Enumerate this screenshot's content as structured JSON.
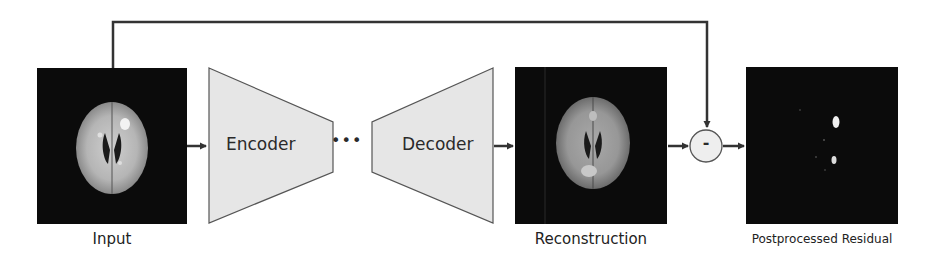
{
  "diagram": {
    "type": "autoencoder-anomaly-pipeline",
    "nodes": [
      {
        "id": "input",
        "label": "Input",
        "kind": "image",
        "content": "axial brain MRI slice with bright lesion"
      },
      {
        "id": "encoder",
        "label": "Encoder",
        "kind": "block-trapezoid-narrowing"
      },
      {
        "id": "bottleneck",
        "label": "•••",
        "kind": "ellipsis"
      },
      {
        "id": "decoder",
        "label": "Decoder",
        "kind": "block-trapezoid-widening"
      },
      {
        "id": "reconstruction",
        "label": "Reconstruction",
        "kind": "image",
        "content": "reconstructed brain MRI slice"
      },
      {
        "id": "subtract",
        "label": "-",
        "kind": "operator-circle"
      },
      {
        "id": "residual",
        "label": "Postprocessed Residual",
        "kind": "image",
        "content": "dark residual map with small bright spots"
      }
    ],
    "edges": [
      {
        "from": "input",
        "to": "encoder"
      },
      {
        "from": "decoder",
        "to": "reconstruction"
      },
      {
        "from": "reconstruction",
        "to": "subtract"
      },
      {
        "from": "input",
        "to": "subtract",
        "route": "skip-connection-over-top"
      },
      {
        "from": "subtract",
        "to": "residual"
      }
    ]
  },
  "labels": {
    "input": "Input",
    "encoder": "Encoder",
    "ellipsis": "•••",
    "decoder": "Decoder",
    "reconstruction": "Reconstruction",
    "minus": "-",
    "residual": "Postprocessed Residual"
  },
  "colors": {
    "block_fill": "#e6e6e6",
    "block_stroke": "#555555",
    "arrow": "#333333",
    "image_bg": "#0b0b0b",
    "operator_fill": "#eeeeee"
  }
}
